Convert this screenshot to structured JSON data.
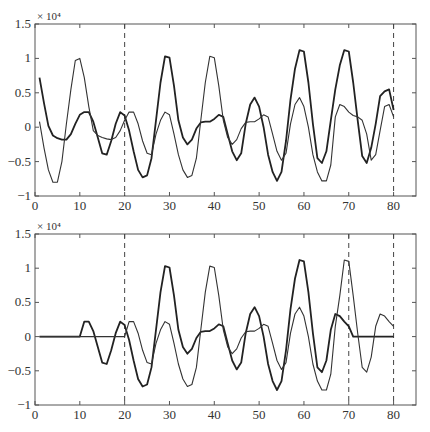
{
  "chart_data": [
    {
      "type": "line",
      "panel": "top",
      "title": "",
      "xlabel": "",
      "ylabel": "",
      "y_exponent_label": "× 10⁴",
      "xlim": [
        0,
        85
      ],
      "ylim": [
        -1,
        1.5
      ],
      "xticks": [
        0,
        10,
        20,
        30,
        40,
        50,
        60,
        70,
        80
      ],
      "yticks": [
        -1,
        -0.5,
        0,
        0.5,
        1,
        1.5
      ],
      "xtick_labels": [
        "0",
        "10",
        "20",
        "30",
        "40",
        "50",
        "60",
        "70",
        "80"
      ],
      "ytick_labels": [
        "−1",
        "−0.5",
        "0",
        "0.5",
        "1",
        "1.5"
      ],
      "grid": false,
      "legend": "none",
      "vertical_dashed_lines": [
        20,
        80
      ],
      "series": [
        {
          "name": "thick",
          "x": [
            1,
            2,
            3,
            4,
            5,
            6,
            7,
            8,
            9,
            10,
            11,
            12,
            13,
            14,
            15,
            16,
            17,
            18,
            19,
            20,
            21,
            22,
            23,
            24,
            25,
            26,
            27,
            28,
            29,
            30,
            31,
            32,
            33,
            34,
            35,
            36,
            37,
            38,
            39,
            40,
            41,
            42,
            43,
            44,
            45,
            46,
            47,
            48,
            49,
            50,
            51,
            52,
            53,
            54,
            55,
            56,
            57,
            58,
            59,
            60,
            61,
            62,
            63,
            64,
            65,
            66,
            67,
            68,
            69,
            70,
            71,
            72,
            73,
            74,
            75,
            76,
            77,
            78,
            79,
            80
          ],
          "values": [
            0.72,
            0.35,
            0.02,
            -0.12,
            -0.16,
            -0.18,
            -0.18,
            -0.1,
            0.05,
            0.18,
            0.22,
            0.22,
            0.08,
            -0.15,
            -0.38,
            -0.4,
            -0.2,
            0.05,
            0.22,
            0.17,
            -0.05,
            -0.35,
            -0.62,
            -0.73,
            -0.7,
            -0.45,
            0.1,
            0.65,
            1.03,
            1.01,
            0.6,
            0.1,
            -0.15,
            -0.25,
            -0.18,
            -0.02,
            0.07,
            0.08,
            0.08,
            0.12,
            0.18,
            0.15,
            -0.1,
            -0.35,
            -0.48,
            -0.38,
            0.05,
            0.33,
            0.43,
            0.3,
            0.0,
            -0.4,
            -0.65,
            -0.78,
            -0.65,
            -0.2,
            0.4,
            0.85,
            1.12,
            1.1,
            0.65,
            0.05,
            -0.45,
            -0.52,
            -0.35,
            0.1,
            0.55,
            0.9,
            1.12,
            1.1,
            0.65,
            0.1,
            -0.42,
            -0.52,
            -0.3,
            0.05,
            0.45,
            0.52,
            0.55,
            0.25
          ]
        },
        {
          "name": "thin",
          "x": [
            1,
            2,
            3,
            4,
            5,
            6,
            7,
            8,
            9,
            10,
            11,
            12,
            13,
            14,
            15,
            16,
            17,
            18,
            19,
            20,
            21,
            22,
            23,
            24,
            25,
            26,
            27,
            28,
            29,
            30,
            31,
            32,
            33,
            34,
            35,
            36,
            37,
            38,
            39,
            40,
            41,
            42,
            43,
            44,
            45,
            46,
            47,
            48,
            49,
            50,
            51,
            52,
            53,
            54,
            55,
            56,
            57,
            58,
            59,
            60,
            61,
            62,
            63,
            64,
            65,
            66,
            67,
            68,
            69,
            70,
            71,
            72,
            73,
            74,
            75,
            76,
            77,
            78,
            79,
            80
          ],
          "values": [
            0.08,
            -0.3,
            -0.62,
            -0.8,
            -0.8,
            -0.5,
            0.05,
            0.55,
            0.97,
            1.0,
            0.72,
            0.3,
            -0.05,
            -0.12,
            -0.15,
            -0.17,
            -0.18,
            -0.15,
            -0.05,
            0.1,
            0.22,
            0.22,
            0.05,
            -0.2,
            -0.38,
            -0.4,
            -0.1,
            0.1,
            0.22,
            0.18,
            -0.1,
            -0.4,
            -0.62,
            -0.73,
            -0.7,
            -0.45,
            0.1,
            0.65,
            1.03,
            1.01,
            0.6,
            0.1,
            -0.15,
            -0.25,
            -0.18,
            -0.02,
            0.07,
            0.08,
            0.08,
            0.12,
            0.18,
            0.15,
            -0.1,
            -0.35,
            -0.48,
            -0.38,
            0.05,
            0.33,
            0.43,
            0.3,
            0.0,
            -0.4,
            -0.65,
            -0.78,
            -0.78,
            -0.55,
            0.15,
            0.33,
            0.3,
            0.22,
            0.17,
            0.15,
            0.1,
            -0.1,
            -0.48,
            -0.4,
            -0.05,
            0.3,
            0.33,
            0.15
          ]
        }
      ]
    },
    {
      "type": "line",
      "panel": "bottom",
      "title": "",
      "xlabel": "",
      "ylabel": "",
      "y_exponent_label": "× 10⁴",
      "xlim": [
        0,
        85
      ],
      "ylim": [
        -1,
        1.5
      ],
      "xticks": [
        0,
        10,
        20,
        30,
        40,
        50,
        60,
        70,
        80
      ],
      "yticks": [
        -1,
        -0.5,
        0,
        0.5,
        1,
        1.5
      ],
      "xtick_labels": [
        "0",
        "10",
        "20",
        "30",
        "40",
        "50",
        "60",
        "70",
        "80"
      ],
      "ytick_labels": [
        "−1",
        "−0.5",
        "0",
        "0.5",
        "1",
        "1.5"
      ],
      "grid": false,
      "legend": "none",
      "vertical_dashed_lines": [
        20,
        70,
        80
      ],
      "series": [
        {
          "name": "thick",
          "x": [
            1,
            2,
            3,
            4,
            5,
            6,
            7,
            8,
            9,
            10,
            11,
            12,
            13,
            14,
            15,
            16,
            17,
            18,
            19,
            20,
            21,
            22,
            23,
            24,
            25,
            26,
            27,
            28,
            29,
            30,
            31,
            32,
            33,
            34,
            35,
            36,
            37,
            38,
            39,
            40,
            41,
            42,
            43,
            44,
            45,
            46,
            47,
            48,
            49,
            50,
            51,
            52,
            53,
            54,
            55,
            56,
            57,
            58,
            59,
            60,
            61,
            62,
            63,
            64,
            65,
            66,
            67,
            68,
            69,
            70,
            71,
            72,
            73,
            74,
            75,
            76,
            77,
            78,
            79,
            80
          ],
          "values": [
            0,
            0,
            0,
            0,
            0,
            0,
            0,
            0,
            0,
            0,
            0.22,
            0.22,
            0.08,
            -0.15,
            -0.38,
            -0.4,
            -0.2,
            0.05,
            0.22,
            0.17,
            -0.05,
            -0.35,
            -0.62,
            -0.73,
            -0.7,
            -0.45,
            0.1,
            0.65,
            1.03,
            1.01,
            0.6,
            0.1,
            -0.15,
            -0.25,
            -0.18,
            -0.02,
            0.07,
            0.08,
            0.08,
            0.12,
            0.18,
            0.15,
            -0.1,
            -0.35,
            -0.48,
            -0.38,
            0.05,
            0.33,
            0.43,
            0.3,
            0.0,
            -0.4,
            -0.65,
            -0.78,
            -0.65,
            -0.2,
            0.4,
            0.85,
            1.12,
            1.1,
            0.65,
            0.05,
            -0.45,
            -0.52,
            -0.35,
            0.1,
            0.33,
            0.3,
            0.22,
            0.15,
            0,
            0,
            0,
            0,
            0,
            0,
            0,
            0,
            0,
            0
          ]
        },
        {
          "name": "thin",
          "x": [
            1,
            2,
            3,
            4,
            5,
            6,
            7,
            8,
            9,
            10,
            11,
            12,
            13,
            14,
            15,
            16,
            17,
            18,
            19,
            20,
            21,
            22,
            23,
            24,
            25,
            26,
            27,
            28,
            29,
            30,
            31,
            32,
            33,
            34,
            35,
            36,
            37,
            38,
            39,
            40,
            41,
            42,
            43,
            44,
            45,
            46,
            47,
            48,
            49,
            50,
            51,
            52,
            53,
            54,
            55,
            56,
            57,
            58,
            59,
            60,
            61,
            62,
            63,
            64,
            65,
            66,
            67,
            68,
            69,
            70,
            71,
            72,
            73,
            74,
            75,
            76,
            77,
            78,
            79,
            80
          ],
          "values": [
            0,
            0,
            0,
            0,
            0,
            0,
            0,
            0,
            0,
            0,
            0,
            0,
            0,
            0,
            0,
            0,
            0,
            0,
            0,
            0,
            0.22,
            0.22,
            0.05,
            -0.2,
            -0.38,
            -0.4,
            -0.1,
            0.1,
            0.22,
            0.18,
            -0.1,
            -0.4,
            -0.62,
            -0.73,
            -0.7,
            -0.45,
            0.1,
            0.65,
            1.03,
            1.01,
            0.6,
            0.1,
            -0.15,
            -0.25,
            -0.18,
            -0.02,
            0.07,
            0.08,
            0.08,
            0.12,
            0.18,
            0.15,
            -0.1,
            -0.35,
            -0.48,
            -0.38,
            0.05,
            0.33,
            0.43,
            0.3,
            0.0,
            -0.4,
            -0.65,
            -0.78,
            -0.78,
            -0.55,
            0.15,
            0.6,
            1.12,
            1.1,
            0.6,
            0.05,
            -0.45,
            -0.52,
            -0.3,
            0.15,
            0.33,
            0.3,
            0.22,
            0.15
          ]
        }
      ]
    }
  ]
}
